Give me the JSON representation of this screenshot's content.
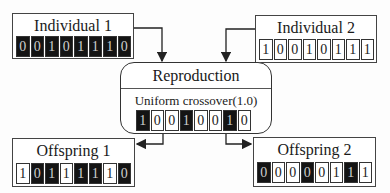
{
  "individual1": {
    "title": "Individual 1",
    "bits": [
      "0",
      "0",
      "1",
      "0",
      "1",
      "1",
      "1",
      "0"
    ],
    "dark": [
      true,
      true,
      true,
      true,
      true,
      true,
      true,
      true
    ]
  },
  "individual2": {
    "title": "Individual 2",
    "bits": [
      "1",
      "0",
      "0",
      "1",
      "0",
      "1",
      "1",
      "1"
    ],
    "dark": [
      false,
      false,
      false,
      false,
      false,
      false,
      false,
      false
    ]
  },
  "reproduction": {
    "title": "Reproduction",
    "operator": "Uniform crossover(1.0)",
    "mask": [
      "1",
      "0",
      "0",
      "1",
      "0",
      "0",
      "1",
      "0"
    ],
    "dark": [
      true,
      false,
      false,
      true,
      false,
      false,
      true,
      false
    ]
  },
  "offspring1": {
    "title": "Offspring 1",
    "bits": [
      "1",
      "0",
      "1",
      "1",
      "1",
      "1",
      "1",
      "0"
    ],
    "dark": [
      false,
      true,
      true,
      false,
      true,
      true,
      false,
      true
    ]
  },
  "offspring2": {
    "title": "Offspring 2",
    "bits": [
      "0",
      "0",
      "0",
      "0",
      "0",
      "1",
      "1",
      "1"
    ],
    "dark": [
      true,
      false,
      false,
      true,
      false,
      false,
      true,
      false
    ]
  },
  "colors": {
    "dark_bit": "#141414",
    "light_bit": "#ffffff",
    "stroke": "#333333"
  }
}
